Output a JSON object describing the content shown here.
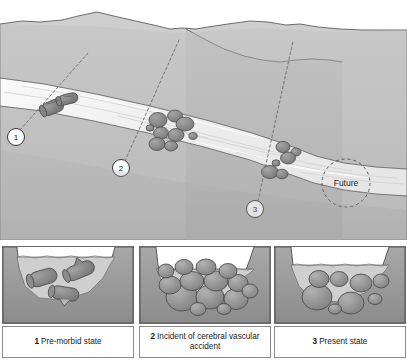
{
  "figure": {
    "background_color": "#ffffff"
  },
  "main_scene": {
    "name": "river-valley-landscape",
    "colors": {
      "sky": "#ffffff",
      "far_hill": "#c9c9c9",
      "near_hill": "#b5b5b5",
      "foreground": "#a9a9a9",
      "river": "#f2f2f2",
      "river_shadow": "#e0e0e0",
      "rock": "#8e8e8e",
      "rock_dark": "#6f6f6f",
      "outline": "#4a4a4a"
    },
    "markers": [
      {
        "id": "marker-1",
        "label": "1",
        "cx": 16,
        "cy": 137,
        "leader_to_x": 88,
        "leader_to_y": 53
      },
      {
        "id": "marker-2",
        "label": "2",
        "cx": 121,
        "cy": 168,
        "leader_to_x": 179,
        "leader_to_y": 40
      },
      {
        "id": "marker-3",
        "label": "3",
        "cx": 255,
        "cy": 209,
        "leader_to_x": 293,
        "leader_to_y": 41
      }
    ],
    "future_zone": {
      "label": "Future",
      "cx": 346,
      "cy": 183,
      "r": 24
    }
  },
  "panels": [
    {
      "id": "panel-1",
      "number": "1",
      "caption": "Pre-morbid state",
      "art_name": "cross-section-premorbid",
      "obstruction_type": "logs",
      "water_level": 14,
      "obstruction_count": 3
    },
    {
      "id": "panel-2",
      "number": "2",
      "caption": "Incident of cerebral vascular accident",
      "art_name": "cross-section-incident",
      "obstruction_type": "boulders",
      "water_level": 26,
      "obstruction_count": 14
    },
    {
      "id": "panel-3",
      "number": "3",
      "caption": "Present state",
      "art_name": "cross-section-present",
      "obstruction_type": "boulders",
      "water_level": 22,
      "obstruction_count": 8
    }
  ]
}
